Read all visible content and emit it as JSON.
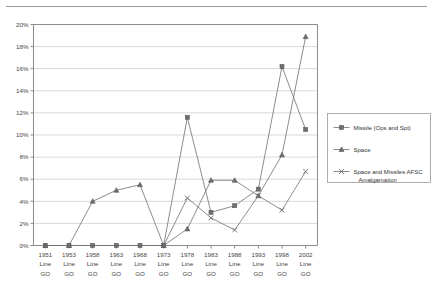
{
  "page": {
    "background": "#ffffff",
    "rule_color": "#9a9a9a"
  },
  "chart_data": {
    "type": "line",
    "title": "",
    "subtitle": "",
    "xlabel": "",
    "ylabel": "",
    "ylim": [
      0,
      20
    ],
    "ytick_values": [
      0,
      2,
      4,
      6,
      8,
      10,
      12,
      14,
      16,
      18,
      20
    ],
    "ytick_labels": [
      "0%",
      "2%",
      "4%",
      "6%",
      "8%",
      "10%",
      "12%",
      "14%",
      "16%",
      "18%",
      "20%"
    ],
    "grid": true,
    "grid_axis": "y",
    "legend_position": "right",
    "categories": [
      "1951 Line GO",
      "1953 Line GO",
      "1958 Line GO",
      "1963 Line GO",
      "1968 Line GO",
      "1973 Line GO",
      "1978 Line GO",
      "1983 Line GO",
      "1988 Line GO",
      "1993 Line GO",
      "1998 Line GO",
      "2002 Line GO"
    ],
    "category_lines": [
      [
        "1951",
        "Line",
        "GO"
      ],
      [
        "1953",
        "Line",
        "GO"
      ],
      [
        "1958",
        "Line",
        "GO"
      ],
      [
        "1963",
        "Line",
        "GO"
      ],
      [
        "1968",
        "Line",
        "GO"
      ],
      [
        "1973",
        "Line",
        "GO"
      ],
      [
        "1978",
        "Line",
        "GO"
      ],
      [
        "1983",
        "Line",
        "GO"
      ],
      [
        "1988",
        "Line",
        "GO"
      ],
      [
        "1993",
        "Line",
        "GO"
      ],
      [
        "1998",
        "Line",
        "GO"
      ],
      [
        "2002",
        "Line",
        "GO"
      ]
    ],
    "series": [
      {
        "name": "Missile (Ops and Spt)",
        "marker": "square",
        "color": "#6e6e6e",
        "values": [
          0.0,
          0.0,
          0.0,
          0.0,
          0.0,
          0.0,
          11.6,
          3.0,
          3.6,
          5.1,
          16.2,
          10.5
        ]
      },
      {
        "name": "Space",
        "marker": "triangle",
        "color": "#6e6e6e",
        "values": [
          0.0,
          0.0,
          4.0,
          5.0,
          5.5,
          0.0,
          1.5,
          5.9,
          5.9,
          4.5,
          8.2,
          18.9
        ]
      },
      {
        "name": "Space and Missiles AFSC Amalgamation",
        "marker": "x",
        "color": "#6e6e6e",
        "values": [
          null,
          null,
          null,
          null,
          null,
          0.0,
          4.3,
          2.5,
          1.4,
          4.5,
          3.2,
          6.7
        ]
      }
    ]
  },
  "legend": {
    "entries": [
      {
        "label": "Missile (Ops and Spt)",
        "marker": "square"
      },
      {
        "label": "Space",
        "marker": "triangle"
      },
      {
        "label": "Space and Missiles AFSC",
        "label2": "Amalgamation",
        "marker": "x"
      }
    ]
  }
}
